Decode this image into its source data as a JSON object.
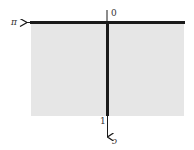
{
  "diagram": {
    "type": "domain-strip",
    "region_fill": "#e6e6e6",
    "axis_color": "#1a1a1a",
    "labels": {
      "left_axis": "π",
      "top_origin": "0",
      "bottom_mark": "1",
      "down_axis": "c"
    }
  }
}
